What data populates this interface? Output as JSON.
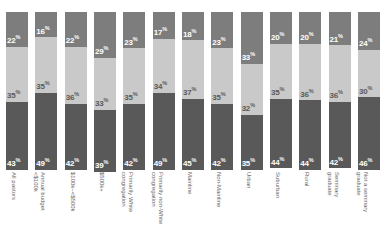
{
  "chart_data": {
    "type": "bar",
    "subtype": "stacked-100-percent-vertical",
    "title": "",
    "subtitle": "",
    "xlabel": "",
    "ylabel": "",
    "ylim": [
      0,
      100
    ],
    "grid": false,
    "legend_position": "none",
    "categories": [
      "All pastors",
      "Annual budget\n<$100k",
      "$100k–<$500k",
      "$500k+",
      "Primarily White\ncongregation",
      "Primarily non-White\ncongregation",
      "Mainline",
      "Non-Mainline",
      "Urban",
      "Suburban",
      "Rural",
      "Seminary\ngraduate",
      "Not a seminary\ngraduate"
    ],
    "series": [
      {
        "name": "top",
        "color": "#7d7d7d",
        "values": [
          22,
          16,
          22,
          29,
          23,
          17,
          18,
          23,
          33,
          20,
          20,
          21,
          24
        ]
      },
      {
        "name": "middle",
        "color": "#c9c9c9",
        "values": [
          35,
          35,
          36,
          33,
          35,
          34,
          37,
          35,
          32,
          35,
          36,
          36,
          30
        ]
      },
      {
        "name": "bottom",
        "color": "#595959",
        "values": [
          43,
          49,
          42,
          39,
          42,
          49,
          45,
          42,
          35,
          44,
          44,
          42,
          46
        ]
      }
    ],
    "value_suffix": "%"
  },
  "colors": {
    "segment_top": "#7d7d7d",
    "segment_middle": "#c9c9c9",
    "segment_bottom": "#595959",
    "background": "#ffffff",
    "label_text": "#6a6a6a",
    "value_text_light": "#ffffff",
    "value_text_dark": "#5a5a5a"
  }
}
